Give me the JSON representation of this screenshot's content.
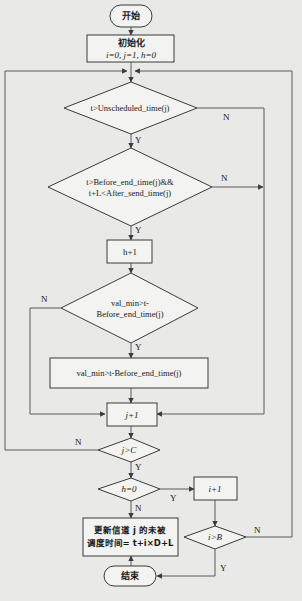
{
  "flowchart": {
    "start": "开始",
    "init": {
      "title": "初始化",
      "values": "i=0, j=1, h=0"
    },
    "cond1": "t>Unscheduled_time(j)",
    "cond2": {
      "line1": "t>Before_end_time(j)&&",
      "line2": "t+L<After_send_time(j)"
    },
    "step_h": "h+1",
    "cond3": {
      "line1": "val_min>t-",
      "line2": "Before_end_time(j)"
    },
    "step_val": "val_min>t-Before_end_time(j)",
    "step_j": "j+1",
    "cond4": "j>C",
    "cond5": "h=0",
    "step_i": "i+1",
    "cond6": "i>B",
    "update": {
      "line1": "更新信道 j 的未被",
      "line2": "调度时间= t+i×D+L"
    },
    "end": "结束",
    "labels": {
      "yes": "Y",
      "no": "N"
    }
  }
}
